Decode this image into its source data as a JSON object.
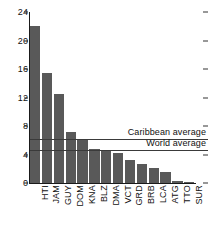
{
  "chart_data": {
    "type": "bar",
    "title": "",
    "subtitle": "",
    "xlabel": "",
    "ylabel": "",
    "ylim": [
      0,
      24
    ],
    "yticks": [
      0,
      4,
      8,
      12,
      16,
      20,
      24
    ],
    "grid": false,
    "legend_position": "none",
    "orientation": "vertical",
    "bar_color": "#595959",
    "categories": [
      "HTI",
      "JAM",
      "GUY",
      "DOM",
      "KNA",
      "BLZ",
      "DMA",
      "VCT",
      "GRD",
      "BRB",
      "LCA",
      "ATG",
      "TTO",
      "SUR"
    ],
    "values": [
      22.0,
      15.4,
      12.5,
      7.2,
      6.2,
      4.8,
      4.5,
      4.2,
      3.3,
      2.7,
      2.1,
      1.6,
      0.3,
      0.05
    ],
    "series": [
      {
        "name": "value",
        "values": [
          22.0,
          15.4,
          12.5,
          7.2,
          6.2,
          4.8,
          4.5,
          4.2,
          3.3,
          2.7,
          2.1,
          1.6,
          0.3,
          0.05
        ]
      }
    ],
    "reference_lines": [
      {
        "label": "Caribbean average",
        "value": 6.2,
        "color": "#3a3a3a"
      },
      {
        "label": "World average",
        "value": 4.6,
        "color": "#3a3a3a"
      }
    ]
  }
}
